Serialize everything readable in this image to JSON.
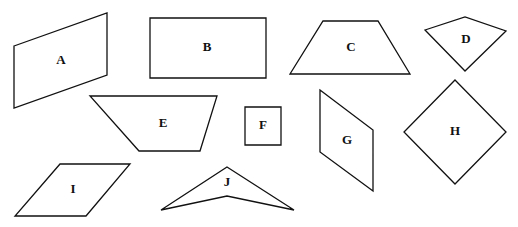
{
  "diagram": {
    "background": "#ffffff",
    "stroke_color": "#111111",
    "shapes": [
      {
        "label": "A",
        "type": "parallelogram",
        "points": "14,46 107,13 107,75 14,108",
        "label_pos": [
          61,
          61
        ]
      },
      {
        "label": "B",
        "type": "rectangle",
        "points": "150,18 266,18 266,78 150,78",
        "label_pos": [
          207,
          48
        ]
      },
      {
        "label": "C",
        "type": "trapezoid",
        "points": "290,74 323,21 378,21 410,74",
        "label_pos": [
          351,
          48
        ]
      },
      {
        "label": "D",
        "type": "kite",
        "points": "425,30 465,17 506,31 465,71",
        "label_pos": [
          466,
          40
        ]
      },
      {
        "label": "E",
        "type": "trapezoid",
        "points": "90,96 217,96 200,151 139,151",
        "label_pos": [
          163,
          124
        ]
      },
      {
        "label": "F",
        "type": "square",
        "points": "245,107 281,107 281,145 245,145",
        "label_pos": [
          263,
          126
        ]
      },
      {
        "label": "G",
        "type": "parallelogram",
        "points": "320,90 373,130 373,191 320,152",
        "label_pos": [
          347,
          141
        ]
      },
      {
        "label": "H",
        "type": "square",
        "points": "455,80 506,132 455,184 404,132",
        "label_pos": [
          455,
          132
        ]
      },
      {
        "label": "I",
        "type": "rhombus",
        "points": "60,164 130,164 86,216 15,216",
        "label_pos": [
          73,
          190
        ]
      },
      {
        "label": "J",
        "type": "concave-kite",
        "points": "227,167 294,210 227,196 161,210",
        "label_pos": [
          227,
          183
        ]
      }
    ]
  }
}
